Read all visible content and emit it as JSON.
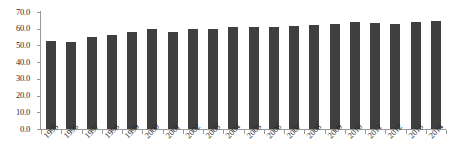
{
  "chart_data": {
    "type": "bar",
    "title": "",
    "subtitle": "",
    "xlabel": "",
    "ylabel": "",
    "grid": false,
    "legend": false,
    "legend_position": "none",
    "bar_color": "#3f3f3f",
    "axis_color": "#9a9a9a",
    "text_color": "#2b2b2b",
    "background_color": "#ffffff",
    "ylim": [
      0.0,
      70.0
    ],
    "ytick_labels": [
      "70.0",
      "60.0",
      "50.0",
      "40.0",
      "30.0",
      "20.0",
      "10.0",
      "0.0"
    ],
    "ytick_values": [
      70.0,
      60.0,
      50.0,
      40.0,
      30.0,
      20.0,
      10.0,
      0.0
    ],
    "categories": [
      "1995",
      "1996",
      "1997",
      "1998",
      "1999",
      "2000",
      "2001",
      "2002",
      "2003",
      "2004",
      "2005",
      "2006",
      "2007",
      "2008",
      "2009",
      "2010",
      "2011",
      "2012",
      "2013",
      "2014"
    ],
    "values": [
      52.5,
      52.0,
      55.0,
      56.1,
      58.0,
      60.0,
      58.1,
      59.7,
      59.9,
      60.8,
      61.2,
      60.8,
      61.8,
      62.1,
      62.6,
      63.9,
      63.7,
      63.0,
      63.8,
      64.6
    ],
    "series": [
      {
        "name": "",
        "values": [
          52.5,
          52.0,
          55.0,
          56.1,
          58.0,
          60.0,
          58.1,
          59.7,
          59.9,
          60.8,
          61.2,
          60.8,
          61.8,
          62.1,
          62.6,
          63.9,
          63.7,
          63.0,
          63.8,
          64.6
        ]
      }
    ]
  }
}
